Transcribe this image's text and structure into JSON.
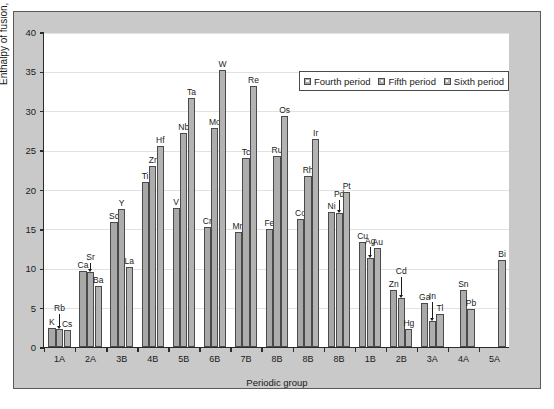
{
  "chart_data": {
    "type": "bar",
    "title": "",
    "xlabel": "Periodic group",
    "ylabel": "Enthalpy of fusion, kJ/mol",
    "ylim": [
      0,
      40
    ],
    "ytick_labels": [
      "0",
      "5",
      "10",
      "15",
      "20",
      "25",
      "30",
      "35",
      "40"
    ],
    "ytick_values": [
      0,
      5,
      10,
      15,
      20,
      25,
      30,
      35,
      40
    ],
    "grid": true,
    "legend_position": "top-right",
    "categories": [
      "1A",
      "2A",
      "3B",
      "4B",
      "5B",
      "6B",
      "7B",
      "8B",
      "8B",
      "8B",
      "1B",
      "2B",
      "3A",
      "4A",
      "5A"
    ],
    "series": [
      {
        "name": "Fourth period",
        "color": "#a8a8a8",
        "values": [
          2.4,
          9.7,
          15.9,
          20.9,
          17.6,
          15.3,
          14.6,
          15.0,
          16.3,
          17.2,
          13.3,
          7.3,
          5.6,
          null,
          null
        ],
        "element_labels": [
          "K",
          "Ca",
          "Sc",
          "Ti",
          "V",
          "Cr",
          "Mn",
          "Fe",
          "Co",
          "Ni",
          "Cu",
          "Zn",
          "Ga",
          "",
          ""
        ]
      },
      {
        "name": "Fifth period",
        "color": "#adadad",
        "values": [
          2.3,
          9.5,
          17.5,
          23.0,
          27.2,
          27.8,
          24.0,
          24.3,
          21.7,
          17.0,
          11.3,
          6.2,
          3.3,
          7.2,
          null
        ],
        "element_labels": [
          "Rb",
          "Sr",
          "Y",
          "Zr",
          "Nb",
          "Mo",
          "Tc",
          "Ru",
          "Rh",
          "Pd",
          "Ag",
          "Cd",
          "In",
          "Sn",
          ""
        ]
      },
      {
        "name": "Sixth period",
        "color": "#b3b3b3",
        "values": [
          2.1,
          7.8,
          10.1,
          25.5,
          31.6,
          35.2,
          33.2,
          29.3,
          26.4,
          19.7,
          12.6,
          2.3,
          4.2,
          4.8,
          11.0
        ],
        "element_labels": [
          "Cs",
          "Ba",
          "La",
          "Hf",
          "Ta",
          "W",
          "Re",
          "Os",
          "Ir",
          "Pt",
          "Au",
          "Hg",
          "Tl",
          "Pb",
          "Bi"
        ]
      }
    ],
    "annotated_with_arrow": [
      "Rb",
      "Sr",
      "Pd",
      "Ag",
      "Cd",
      "In"
    ]
  },
  "legend": {
    "items": [
      {
        "label": "Fourth period",
        "swatch": "fourth-period-swatch"
      },
      {
        "label": "Fifth period",
        "swatch": "fifth-period-swatch"
      },
      {
        "label": "Sixth period",
        "swatch": "sixth-period-swatch"
      }
    ]
  },
  "axes": {
    "y_title": "Enthalpy of fusion, kJ/mol",
    "x_title": "Periodic group"
  },
  "colors": {
    "panel_background": "#c9c9c9",
    "plot_background": "#ffffff",
    "axis": "#2b2b2b",
    "grid": "#e2e2e2",
    "bar_fourth": "#a8a8a8",
    "bar_fifth": "#adadad",
    "bar_sixth": "#b3b3b3"
  }
}
